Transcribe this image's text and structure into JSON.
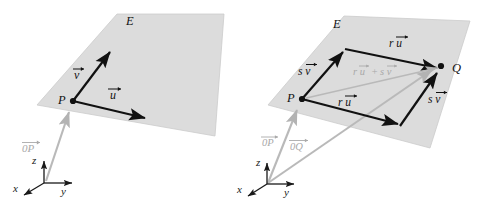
{
  "figure": {
    "background_color": "#ffffff",
    "plane_fill": "#dcdcdc",
    "plane_stroke": "#c2c2c2",
    "vector_color": "#111111",
    "gray_vector_color": "#b0b0b0",
    "axis_color": "#1a1a1a"
  },
  "panels": [
    {
      "id": "left-panel",
      "plane_label": "E",
      "point_labels": [
        {
          "name": "point-p",
          "text": "P"
        }
      ],
      "vectors": [
        {
          "name": "vector-v",
          "label": "v",
          "accent": "arrow",
          "style": "black"
        },
        {
          "name": "vector-u",
          "label": "u",
          "accent": "arrow",
          "style": "black"
        },
        {
          "name": "vector-op",
          "label": "0P",
          "accent": "arrow",
          "style": "gray"
        }
      ],
      "axes": [
        {
          "name": "axis-z",
          "label": "z"
        },
        {
          "name": "axis-y",
          "label": "y"
        },
        {
          "name": "axis-x",
          "label": "x"
        }
      ]
    },
    {
      "id": "right-panel",
      "plane_label": "E",
      "point_labels": [
        {
          "name": "point-p",
          "text": "P"
        },
        {
          "name": "point-q",
          "text": "Q"
        }
      ],
      "vectors": [
        {
          "name": "vector-sv-upper",
          "label": "s v",
          "accent": "arrow",
          "style": "black"
        },
        {
          "name": "vector-ru-upper",
          "label": "r u",
          "accent": "arrow",
          "style": "black"
        },
        {
          "name": "vector-ru-lower",
          "label": "r u",
          "accent": "arrow",
          "style": "black"
        },
        {
          "name": "vector-sv-lower",
          "label": "s v",
          "accent": "arrow",
          "style": "black"
        },
        {
          "name": "vector-diagonal",
          "label": "r u + s v",
          "accent": "arrow",
          "style": "gray"
        },
        {
          "name": "vector-op",
          "label": "0P",
          "accent": "arrow",
          "style": "gray"
        },
        {
          "name": "vector-oq",
          "label": "0Q",
          "accent": "arrow",
          "style": "gray"
        }
      ],
      "axes": [
        {
          "name": "axis-z",
          "label": "z"
        },
        {
          "name": "axis-y",
          "label": "y"
        },
        {
          "name": "axis-x",
          "label": "x"
        }
      ]
    }
  ],
  "labels": {
    "E_left": "E",
    "E_right": "E",
    "P_left": "P",
    "P_right": "P",
    "Q_right": "Q",
    "v_left": "v",
    "u_left": "u",
    "OP_left": "0P",
    "z_left": "z",
    "y_left": "y",
    "x_left": "x",
    "sv_upper": "s v",
    "ru_upper": "r u",
    "ru_lower": "r u",
    "sv_lower": "s v",
    "diagonal_r": "r u",
    "diagonal_plus": "+",
    "diagonal_s": "s v",
    "OP_right": "0P",
    "OQ_right": "0Q",
    "z_right": "z",
    "y_right": "y",
    "x_right": "x"
  }
}
